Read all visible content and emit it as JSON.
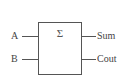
{
  "diagram": {
    "block": {
      "symbol": "Σ",
      "name": "half-adder"
    },
    "inputs": [
      {
        "label": "A"
      },
      {
        "label": "B"
      }
    ],
    "outputs": [
      {
        "label": "Sum"
      },
      {
        "label": "Cout"
      }
    ],
    "colors": {
      "stroke": "#555555",
      "text": "#444444",
      "background": "#ffffff"
    }
  }
}
